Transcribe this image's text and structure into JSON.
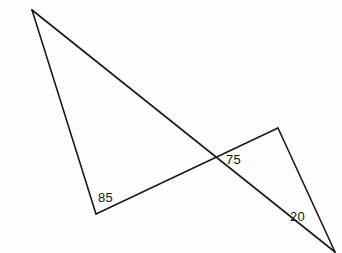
{
  "figure": {
    "width": 342,
    "height": 253,
    "background_color": "#fdfdfd",
    "line_color": "#1a1a1a",
    "label_color": "#141414"
  },
  "chart_data": {
    "type": "diagram",
    "title": "",
    "subtitle": "",
    "xlabel": "",
    "ylabel": "",
    "points": [
      {
        "id": "A",
        "label": "",
        "x": 32,
        "y": 10
      },
      {
        "id": "B",
        "label": "",
        "x": 96,
        "y": 214
      },
      {
        "id": "C",
        "label": "",
        "x": 278,
        "y": 128
      },
      {
        "id": "D",
        "label": "",
        "x": 335,
        "y": 252
      },
      {
        "id": "X",
        "label": "",
        "x": 212,
        "y": 161
      }
    ],
    "segments": [
      {
        "id": "AB",
        "from": "A",
        "to": "B",
        "comment": "left edge of left triangle"
      },
      {
        "id": "AD",
        "from": "A",
        "to": "D",
        "comment": "long transversal from top apex to bottom-right vertex"
      },
      {
        "id": "BC",
        "from": "B",
        "to": "C",
        "comment": "transversal from lower-left vertex to right peak"
      },
      {
        "id": "CD",
        "from": "C",
        "to": "D",
        "comment": "right edge of right triangle"
      }
    ],
    "annotations": [
      {
        "id": "angle-85",
        "text": "85",
        "at_point": "B",
        "x": 98,
        "y": 191,
        "units": "degrees",
        "value": 85
      },
      {
        "id": "angle-75",
        "text": "75",
        "at_point": "X",
        "x": 226,
        "y": 153,
        "units": "degrees",
        "value": 75
      },
      {
        "id": "angle-20",
        "text": "20",
        "at_point": "D",
        "x": 290,
        "y": 210,
        "units": "degrees",
        "value": 20
      }
    ],
    "legend": [],
    "grid": false
  }
}
